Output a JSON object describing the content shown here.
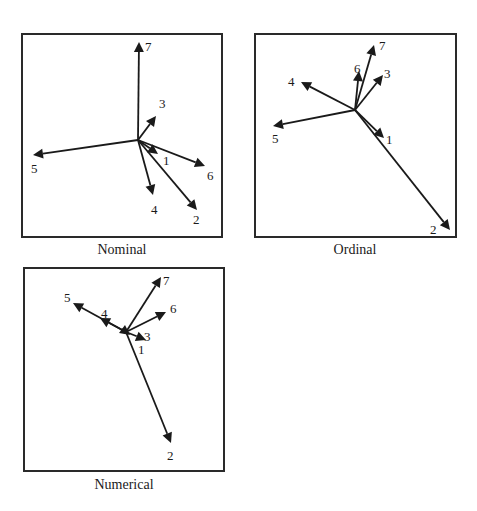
{
  "chart_data": [
    {
      "type": "biplot-vectors",
      "title": "Nominal",
      "box": {
        "x": 22,
        "y": 34,
        "w": 200,
        "h": 203
      },
      "origin": [
        138,
        140
      ],
      "vectors": [
        {
          "label": "1",
          "tip": [
            158,
            154
          ],
          "label_pos": [
            163,
            165
          ]
        },
        {
          "label": "2",
          "tip": [
            197,
            210
          ],
          "label_pos": [
            193,
            224
          ]
        },
        {
          "label": "3",
          "tip": [
            156,
            116
          ],
          "label_pos": [
            159,
            108
          ]
        },
        {
          "label": "4",
          "tip": [
            153,
            195
          ],
          "label_pos": [
            151,
            214
          ]
        },
        {
          "label": "5",
          "tip": [
            33,
            155
          ],
          "label_pos": [
            31,
            173
          ]
        },
        {
          "label": "6",
          "tip": [
            205,
            166
          ],
          "label_pos": [
            207,
            180
          ]
        },
        {
          "label": "7",
          "tip": [
            139,
            42
          ],
          "label_pos": [
            145,
            51
          ]
        }
      ]
    },
    {
      "type": "biplot-vectors",
      "title": "Ordinal",
      "box": {
        "x": 255,
        "y": 34,
        "w": 201,
        "h": 203
      },
      "origin": [
        355,
        110
      ],
      "vectors": [
        {
          "label": "1",
          "tip": [
            384,
            138
          ],
          "label_pos": [
            386,
            144
          ]
        },
        {
          "label": "2",
          "tip": [
            450,
            230
          ],
          "label_pos": [
            430,
            234
          ]
        },
        {
          "label": "3",
          "tip": [
            383,
            75
          ],
          "label_pos": [
            384,
            78
          ]
        },
        {
          "label": "4",
          "tip": [
            301,
            82
          ],
          "label_pos": [
            288,
            86
          ]
        },
        {
          "label": "5",
          "tip": [
            273,
            126
          ],
          "label_pos": [
            272,
            143
          ]
        },
        {
          "label": "6",
          "tip": [
            359,
            71
          ],
          "label_pos": [
            354,
            73
          ]
        },
        {
          "label": "7",
          "tip": [
            374,
            45
          ],
          "label_pos": [
            379,
            50
          ]
        }
      ]
    },
    {
      "type": "biplot-vectors",
      "title": "Numerical",
      "box": {
        "x": 24,
        "y": 268,
        "w": 200,
        "h": 203
      },
      "origin": [
        126,
        332
      ],
      "vectors": [
        {
          "label": "1",
          "tip": [
            130,
            335
          ],
          "label_pos": [
            138,
            354
          ]
        },
        {
          "label": "2",
          "tip": [
            171,
            443
          ],
          "label_pos": [
            167,
            460
          ]
        },
        {
          "label": "3",
          "tip": [
            146,
            340
          ],
          "label_pos": [
            144,
            341
          ]
        },
        {
          "label": "4",
          "tip": [
            100,
            318
          ],
          "label_pos": [
            101,
            318
          ]
        },
        {
          "label": "5",
          "tip": [
            73,
            303
          ],
          "label_pos": [
            64,
            302
          ]
        },
        {
          "label": "6",
          "tip": [
            166,
            312
          ],
          "label_pos": [
            170,
            313
          ]
        },
        {
          "label": "7",
          "tip": [
            161,
            277
          ],
          "label_pos": [
            163,
            285
          ]
        }
      ]
    }
  ],
  "captions": {
    "nominal": "Nominal",
    "ordinal": "Ordinal",
    "numerical": "Numerical"
  }
}
